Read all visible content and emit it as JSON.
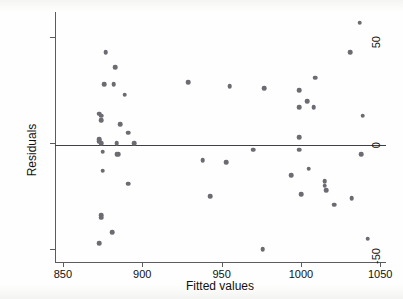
{
  "figure": {
    "kind": "residual-scatter-plot",
    "background_color": "#fefefe",
    "point_color": "#6b6b72",
    "axis_color": "#5a5a60",
    "zero_line_color": "#3f3f45"
  },
  "chart_data": {
    "type": "scatter",
    "title": "",
    "xlabel": "Fitted values",
    "ylabel": "Residuals",
    "xlim": [
      845,
      1053
    ],
    "ylim": [
      -56,
      62
    ],
    "xticks": [
      850,
      900,
      950,
      1000,
      1050
    ],
    "yticks": [
      50,
      0,
      -50
    ],
    "xticklabels": [
      "850",
      "900",
      "950",
      "1000",
      "1050"
    ],
    "yticklabels": [
      "50",
      "0",
      "-50"
    ],
    "grid": false,
    "legend": null,
    "reference_lines": [
      {
        "axis": "y",
        "value": 0,
        "style": "solid"
      }
    ],
    "marker": "circle",
    "n_points": 52,
    "points": [
      {
        "x": 877,
        "y": 43
      },
      {
        "x": 883,
        "y": 36
      },
      {
        "x": 876,
        "y": 28
      },
      {
        "x": 882,
        "y": 28
      },
      {
        "x": 889,
        "y": 23
      },
      {
        "x": 873,
        "y": 14
      },
      {
        "x": 874,
        "y": 13
      },
      {
        "x": 874,
        "y": 11
      },
      {
        "x": 886,
        "y": 9
      },
      {
        "x": 891,
        "y": 5
      },
      {
        "x": 873,
        "y": 2
      },
      {
        "x": 873,
        "y": 1
      },
      {
        "x": 874,
        "y": 0
      },
      {
        "x": 884,
        "y": 0
      },
      {
        "x": 895,
        "y": 0
      },
      {
        "x": 875,
        "y": -4
      },
      {
        "x": 884,
        "y": -5
      },
      {
        "x": 885,
        "y": -5
      },
      {
        "x": 875,
        "y": -13
      },
      {
        "x": 891,
        "y": -19
      },
      {
        "x": 874,
        "y": -34
      },
      {
        "x": 874,
        "y": -35
      },
      {
        "x": 881,
        "y": -42
      },
      {
        "x": 873,
        "y": -47
      },
      {
        "x": 929,
        "y": 29
      },
      {
        "x": 955,
        "y": 27
      },
      {
        "x": 977,
        "y": 26
      },
      {
        "x": 970,
        "y": -3
      },
      {
        "x": 938,
        "y": -8
      },
      {
        "x": 953,
        "y": -9
      },
      {
        "x": 943,
        "y": -25
      },
      {
        "x": 976,
        "y": -50
      },
      {
        "x": 1009,
        "y": 31
      },
      {
        "x": 999,
        "y": 25
      },
      {
        "x": 1004,
        "y": 20
      },
      {
        "x": 999,
        "y": 17
      },
      {
        "x": 1008,
        "y": 17
      },
      {
        "x": 999,
        "y": 3
      },
      {
        "x": 999,
        "y": -3
      },
      {
        "x": 994,
        "y": -15
      },
      {
        "x": 1005,
        "y": -12
      },
      {
        "x": 1000,
        "y": -24
      },
      {
        "x": 1015,
        "y": -18
      },
      {
        "x": 1015,
        "y": -20
      },
      {
        "x": 1016,
        "y": -22
      },
      {
        "x": 1021,
        "y": -29
      },
      {
        "x": 1032,
        "y": -26
      },
      {
        "x": 1037,
        "y": 57
      },
      {
        "x": 1031,
        "y": 43
      },
      {
        "x": 1039,
        "y": 13
      },
      {
        "x": 1038,
        "y": -5
      },
      {
        "x": 1042,
        "y": -45
      }
    ]
  }
}
